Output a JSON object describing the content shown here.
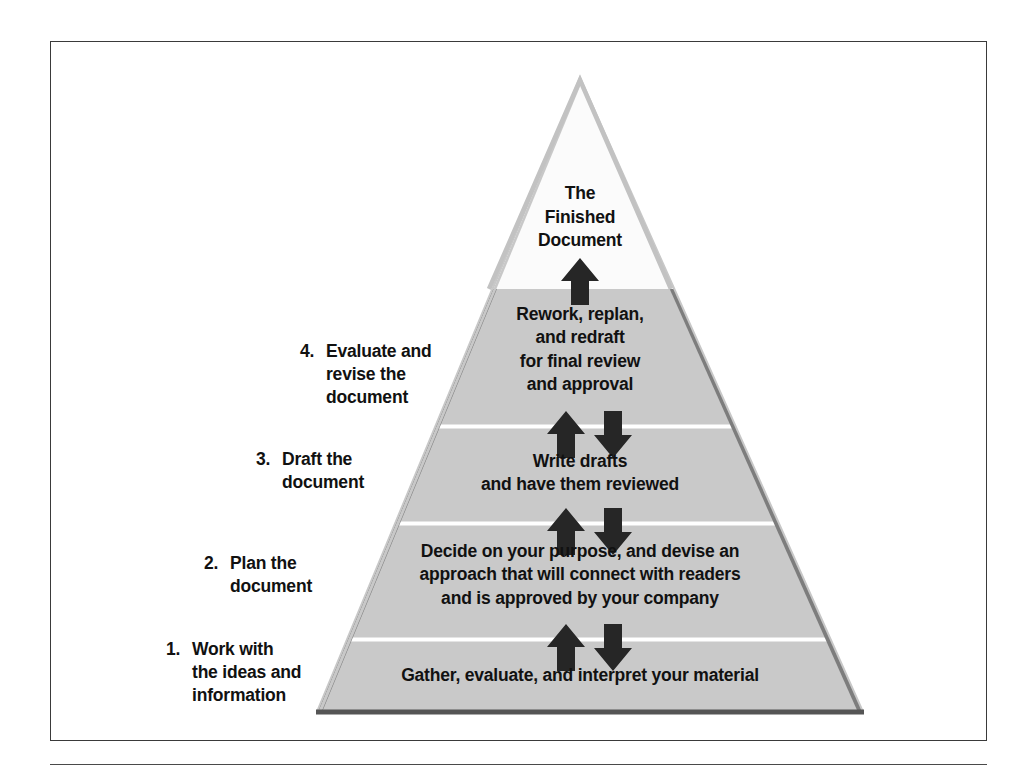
{
  "figure": {
    "name": "document-production-pyramid",
    "colors": {
      "frame_border": "#3a3a3a",
      "pyramid_fill_gray": "#c9c9c9",
      "pyramid_fill_white": "#fbfbfb",
      "pyramid_border_dark": "#7a7a7a",
      "pyramid_border_light": "#c0c0c0",
      "divider_line": "#ffffff",
      "arrow_fill": "#262626",
      "text": "#111111",
      "page_background": "#ffffff"
    }
  },
  "pyramid": {
    "apex": {
      "text": "The\nFinished\nDocument"
    },
    "levels": [
      {
        "step_number": "4.",
        "side_label": "Evaluate and\nrevise the\ndocument",
        "interior_text": "Rework, replan,\nand redraft\nfor final review\nand approval"
      },
      {
        "step_number": "3.",
        "side_label": "Draft the\ndocument",
        "interior_text": "Write drafts\nand have them reviewed"
      },
      {
        "step_number": "2.",
        "side_label": "Plan the\ndocument",
        "interior_text": "Decide on your purpose, and devise an\napproach that will connect with readers\nand is approved by your company"
      },
      {
        "step_number": "1.",
        "side_label": "Work with\nthe ideas and\ninformation",
        "interior_text": "Gather, evaluate, and interpret your material"
      }
    ],
    "arrow_groups": [
      {
        "name": "apex-arrow",
        "up": true,
        "down": false
      },
      {
        "name": "level4-arrows",
        "up": true,
        "down": true
      },
      {
        "name": "level3-arrows",
        "up": true,
        "down": true
      },
      {
        "name": "level2-arrows",
        "up": true,
        "down": true
      }
    ]
  }
}
